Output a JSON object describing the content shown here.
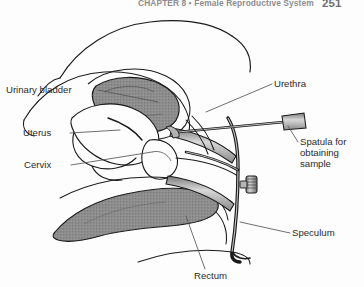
{
  "running_head": {
    "text": "CHAPTER 8 ▪ Female Reproductive System",
    "page_number": "251"
  },
  "figure": {
    "labels": {
      "urinary_bladder": "Urinary bladder",
      "uterus": "Uterus",
      "cervix": "Cervix",
      "urethra": "Urethra",
      "spatula": "Spatula for obtaining sample",
      "speculum": "Speculum",
      "rectum": "Rectum"
    },
    "colors": {
      "outline": "#1a1a1a",
      "leader_line": "#55555a",
      "shading_gray": "#8d8d8d",
      "shading_light": "#b8b8b8",
      "instrument_gray": "#9a9a9a",
      "background": "#fdfdfd",
      "label_text": "#2b2b2b",
      "running_head_text": "#8d8d91"
    }
  }
}
